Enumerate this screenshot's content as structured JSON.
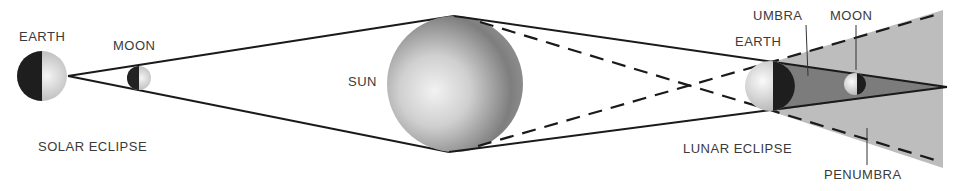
{
  "labels": {
    "earth_left": "EARTH",
    "moon_left": "MOON",
    "solar_eclipse": "SOLAR ECLIPSE",
    "sun": "SUN",
    "umbra": "UMBRA",
    "moon_right": "MOON",
    "earth_right": "EARTH",
    "lunar_eclipse": "LUNAR ECLIPSE",
    "penumbra": "PENUMBRA"
  },
  "colors": {
    "line": "#1a1a1a",
    "penumbra_fill": "#b8b8b8",
    "umbra_fill": "#7a7a7a",
    "label": "#3a3a3a",
    "background": "#ffffff"
  }
}
